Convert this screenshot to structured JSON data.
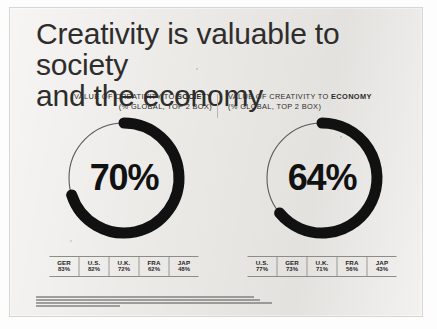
{
  "document": {
    "title_line1": "Creativity is valuable to society",
    "title_line2": "and the economy"
  },
  "panels": [
    {
      "id": "society",
      "kicker_prefix": "VALUE OF CREATIVITY TO ",
      "kicker_emphasis": "SOCIETY",
      "kicker_sub": "(% GLOBAL, TOP 2 BOX)",
      "value_label": "70%",
      "value": 70,
      "columns": [
        "GER",
        "U.S.",
        "U.K.",
        "FRA",
        "JAP"
      ],
      "values": [
        "83%",
        "82%",
        "72%",
        "62%",
        "48%"
      ]
    },
    {
      "id": "economy",
      "kicker_prefix": "VALUE OF CREATIVITY TO ",
      "kicker_emphasis": "ECONOMY",
      "kicker_sub": "(% GLOBAL, TOP 2 BOX)",
      "value_label": "64%",
      "value": 64,
      "columns": [
        "U.S.",
        "GER",
        "U.K.",
        "FRA",
        "JAP"
      ],
      "values": [
        "77%",
        "73%",
        "71%",
        "56%",
        "43%"
      ]
    }
  ],
  "footnotes": {
    "legible": false,
    "line_count": 4
  },
  "colors": {
    "page_background": "#eceae7",
    "arc": "#111111",
    "track": "#5b5956",
    "text": "#2e2d2c",
    "rule": "#8e8c89"
  },
  "chart_data": [
    {
      "type": "pie",
      "title": "VALUE OF CREATIVITY TO SOCIETY",
      "subtitle": "(% GLOBAL, TOP 2 BOX)",
      "categories": [
        "Value of creativity to society",
        "Remainder"
      ],
      "values": [
        70,
        30
      ],
      "center_label": "70%",
      "ylim": [
        0,
        100
      ],
      "legend": "none",
      "breakdown": {
        "type": "table",
        "categories": [
          "GER",
          "U.S.",
          "U.K.",
          "FRA",
          "JAP"
        ],
        "values": [
          83,
          82,
          72,
          62,
          48
        ],
        "ylabel": "% top 2 box"
      }
    },
    {
      "type": "pie",
      "title": "VALUE OF CREATIVITY TO ECONOMY",
      "subtitle": "(% GLOBAL, TOP 2 BOX)",
      "categories": [
        "Value of creativity to economy",
        "Remainder"
      ],
      "values": [
        64,
        36
      ],
      "center_label": "64%",
      "ylim": [
        0,
        100
      ],
      "legend": "none",
      "breakdown": {
        "type": "table",
        "categories": [
          "U.S.",
          "GER",
          "U.K.",
          "FRA",
          "JAP"
        ],
        "values": [
          77,
          73,
          71,
          56,
          43
        ],
        "ylabel": "% top 2 box"
      }
    }
  ]
}
